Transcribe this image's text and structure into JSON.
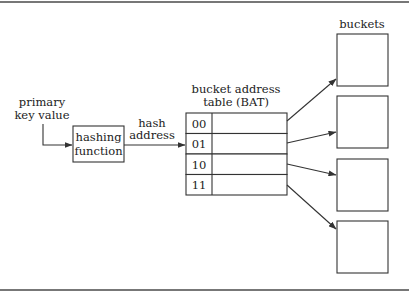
{
  "diagram": {
    "input_label": [
      "primary",
      "key value"
    ],
    "hash_function_label": [
      "hashing",
      "function"
    ],
    "hash_address_label": [
      "hash",
      "address"
    ],
    "bat_label": [
      "bucket address",
      "table (BAT)"
    ],
    "buckets_label": "buckets",
    "bat_rows": [
      {
        "key": "00",
        "target_bucket": 1
      },
      {
        "key": "01",
        "target_bucket": 2
      },
      {
        "key": "10",
        "target_bucket": 3
      },
      {
        "key": "11",
        "target_bucket": 4
      }
    ],
    "bucket_count": 4,
    "colors": {
      "stroke": "#333333",
      "text": "#222222",
      "rule": "#777777",
      "background": "#ffffff"
    }
  }
}
